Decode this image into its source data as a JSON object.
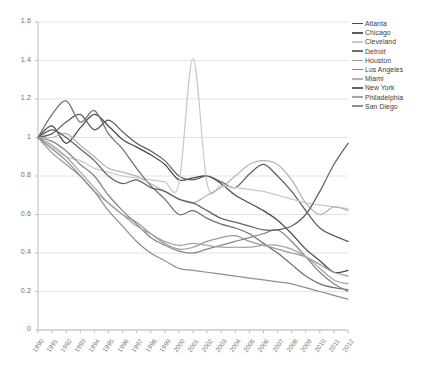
{
  "chart_data": {
    "type": "line",
    "title": "",
    "xlabel": "",
    "ylabel": "",
    "ylim": [
      0,
      1.6
    ],
    "ytick_labels": [
      "1.6",
      "1.4",
      "1.2",
      "1",
      "0.8",
      "0.6",
      "0.4",
      "0.2",
      "0"
    ],
    "ytick_values": [
      1.6,
      1.4,
      1.2,
      1.0,
      0.8,
      0.6,
      0.4,
      0.2,
      0
    ],
    "grid": true,
    "legend_position": "right",
    "categories": [
      "1990",
      "1991",
      "1992",
      "1993",
      "1994",
      "1995",
      "1996",
      "1997",
      "1998",
      "1999",
      "2000",
      "2001",
      "2002",
      "2003",
      "2004",
      "2005",
      "2006",
      "2007",
      "2008",
      "2009",
      "2010",
      "2011",
      "2012"
    ],
    "x": [
      1990,
      1991,
      1992,
      1993,
      1994,
      1995,
      1996,
      1997,
      1998,
      1999,
      2000,
      2001,
      2002,
      2003,
      2004,
      2005,
      2006,
      2007,
      2008,
      2009,
      2010,
      2011,
      2012
    ],
    "series": [
      {
        "name": "Atlanta",
        "color": "#4a4a4a",
        "values": [
          1.0,
          1.06,
          0.97,
          1.05,
          1.12,
          1.06,
          0.99,
          0.95,
          0.91,
          0.86,
          0.78,
          0.79,
          0.8,
          0.76,
          0.7,
          0.66,
          0.62,
          0.57,
          0.5,
          0.42,
          0.36,
          0.3,
          0.31
        ]
      },
      {
        "name": "Chicago",
        "color": "#5d5d5d",
        "values": [
          1.0,
          1.02,
          1.08,
          1.12,
          1.04,
          1.09,
          1.03,
          0.97,
          0.93,
          0.88,
          0.8,
          0.78,
          0.8,
          0.77,
          0.74,
          0.81,
          0.86,
          0.8,
          0.72,
          0.62,
          0.53,
          0.49,
          0.46
        ]
      },
      {
        "name": "Cleveland",
        "color": "#c9c9c9",
        "values": [
          1.0,
          0.95,
          0.9,
          0.88,
          0.84,
          0.82,
          0.8,
          0.79,
          0.78,
          0.77,
          0.76,
          1.41,
          0.76,
          0.75,
          0.74,
          0.73,
          0.72,
          0.7,
          0.68,
          0.66,
          0.65,
          0.64,
          0.63
        ]
      },
      {
        "name": "Detroit",
        "color": "#707070",
        "values": [
          1.0,
          1.12,
          1.19,
          1.08,
          1.14,
          1.02,
          0.94,
          0.84,
          0.75,
          0.68,
          0.6,
          0.62,
          0.58,
          0.55,
          0.53,
          0.5,
          0.45,
          0.4,
          0.34,
          0.28,
          0.24,
          0.22,
          0.21
        ]
      },
      {
        "name": "Houston",
        "color": "#9a9a9a",
        "values": [
          1.0,
          0.92,
          0.86,
          0.8,
          0.72,
          0.66,
          0.6,
          0.56,
          0.5,
          0.45,
          0.42,
          0.43,
          0.46,
          0.48,
          0.49,
          0.46,
          0.44,
          0.42,
          0.4,
          0.38,
          0.34,
          0.3,
          0.28
        ]
      },
      {
        "name": "Los Angeles",
        "color": "#868686",
        "values": [
          1.0,
          0.98,
          0.93,
          0.86,
          0.8,
          0.7,
          0.62,
          0.55,
          0.48,
          0.44,
          0.41,
          0.4,
          0.42,
          0.44,
          0.46,
          0.48,
          0.5,
          0.52,
          0.46,
          0.38,
          0.3,
          0.24,
          0.2
        ]
      },
      {
        "name": "Miami",
        "color": "#b3b3b3",
        "values": [
          1.0,
          1.0,
          1.02,
          0.96,
          0.9,
          0.84,
          0.82,
          0.8,
          0.76,
          0.72,
          0.68,
          0.66,
          0.7,
          0.74,
          0.8,
          0.86,
          0.88,
          0.86,
          0.78,
          0.66,
          0.6,
          0.64,
          0.62
        ]
      },
      {
        "name": "New York",
        "color": "#626262",
        "values": [
          1.0,
          1.04,
          1.0,
          0.94,
          0.88,
          0.8,
          0.76,
          0.78,
          0.74,
          0.72,
          0.68,
          0.66,
          0.62,
          0.58,
          0.56,
          0.54,
          0.52,
          0.52,
          0.54,
          0.6,
          0.72,
          0.86,
          0.97
        ]
      },
      {
        "name": "Philadelphia",
        "color": "#a5a5a5",
        "values": [
          1.0,
          0.96,
          0.9,
          0.82,
          0.74,
          0.66,
          0.6,
          0.54,
          0.5,
          0.46,
          0.44,
          0.45,
          0.44,
          0.43,
          0.43,
          0.43,
          0.44,
          0.44,
          0.42,
          0.38,
          0.32,
          0.26,
          0.24
        ]
      },
      {
        "name": "San Diego",
        "color": "#8f8f8f",
        "values": [
          1.0,
          0.94,
          0.88,
          0.8,
          0.72,
          0.62,
          0.54,
          0.46,
          0.4,
          0.36,
          0.32,
          0.31,
          0.3,
          0.29,
          0.28,
          0.27,
          0.26,
          0.25,
          0.24,
          0.22,
          0.2,
          0.18,
          0.16
        ]
      }
    ]
  },
  "legend": {
    "items": [
      {
        "label": "Atlanta"
      },
      {
        "label": "Chicago"
      },
      {
        "label": "Cleveland"
      },
      {
        "label": "Detroit"
      },
      {
        "label": "Houston"
      },
      {
        "label": "Los Angeles"
      },
      {
        "label": "Miami"
      },
      {
        "label": "New York"
      },
      {
        "label": "Philadelphia"
      },
      {
        "label": "San Diego"
      }
    ]
  },
  "axes": {
    "grid_color": "#e2e2e2",
    "axis_color": "#bdbdbd",
    "tick_text_color": "#6e6e6e"
  },
  "plot_geometry": {
    "left": 38,
    "right": 348,
    "top": 22,
    "bottom": 330
  }
}
